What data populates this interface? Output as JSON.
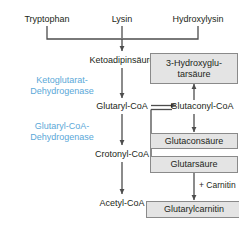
{
  "diagram": {
    "accent_color": "#5ba8d8",
    "text_color": "#231f20",
    "box_fill": "#e4e4e4",
    "box_border": "#8a8a8a",
    "arrow_color": "#4d4d4d",
    "background": "#ffffff"
  },
  "precursors": {
    "tryptophan": "Tryptophan",
    "lysin": "Lysin",
    "hydroxylysin": "Hydroxylysin"
  },
  "metabolites": {
    "ketoadipinsaeure": "Ketoadipinsäure",
    "glutaryl_coa": "Glutaryl-CoA",
    "glutaconyl_coa": "Glutaconyl-CoA",
    "crotonyl_coa": "Crotonyl-CoA",
    "acetyl_coa": "Acetyl-CoA"
  },
  "enzymes": {
    "ketoglutarat_dehydrogenase_line1": "Ketoglutarat-",
    "ketoglutarat_dehydrogenase_line2": "Dehydrogenase",
    "glutaryl_coa_dehydrogenase_line1": "Glutaryl-CoA-",
    "glutaryl_coa_dehydrogenase_line2": "Dehydrogenase"
  },
  "markers": {
    "hydroxyglutarsaeure_line1": "3-Hydroxyglu-",
    "hydroxyglutarsaeure_line2": "tarsäure",
    "glutaconsaeure": "Glutaconsäure",
    "glutarsaeure": "Glutarsäure",
    "glutarylcarnitin": "Glutarylcarnitin"
  },
  "cofactors": {
    "carnitin": "+ Carnitin"
  }
}
